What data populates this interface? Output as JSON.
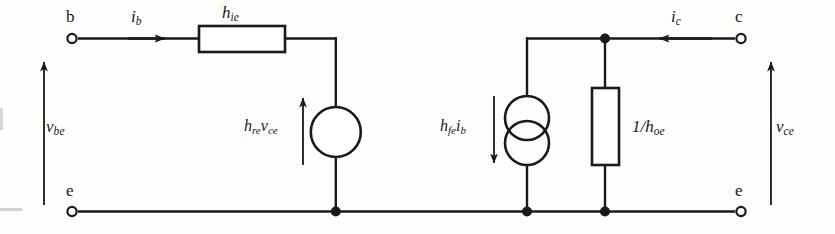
{
  "diagram": {
    "stroke_color": "#1a1a1a",
    "background_color": "#fdfdfc",
    "width": 835,
    "height": 234
  },
  "terminals": [
    {
      "name": "terminal-b",
      "label": "b",
      "x": 72,
      "y": 38,
      "label_x": 66,
      "label_y": 8
    },
    {
      "name": "terminal-c",
      "label": "c",
      "x": 741,
      "y": 38,
      "label_x": 735,
      "label_y": 8
    },
    {
      "name": "terminal-e-left",
      "label": "e",
      "x": 72,
      "y": 211,
      "label_x": 66,
      "label_y": 182
    },
    {
      "name": "terminal-e-right",
      "label": "e",
      "x": 741,
      "y": 211,
      "label_x": 735,
      "label_y": 182
    }
  ],
  "currents": [
    {
      "name": "current-ib",
      "symbol": "i",
      "subscript": "b",
      "direction": "right",
      "label_x": 131,
      "label_y": 8
    },
    {
      "name": "current-ic",
      "symbol": "i",
      "subscript": "c",
      "direction": "left",
      "label_x": 671,
      "label_y": 8
    }
  ],
  "voltages": [
    {
      "name": "voltage-vbe",
      "symbol": "v",
      "subscript": "be",
      "direction": "up",
      "label_x": 46,
      "label_y": 118
    },
    {
      "name": "voltage-vce",
      "symbol": "v",
      "subscript": "ce",
      "direction": "up",
      "label_x": 776,
      "label_y": 118
    }
  ],
  "components": [
    {
      "name": "resistor-hie",
      "type": "resistor-horizontal",
      "symbol": "h",
      "subscript": "ie",
      "label": "h_ie",
      "label_x": 222,
      "label_y": 4
    },
    {
      "name": "voltage-source-hre-vce",
      "type": "voltage-source",
      "label": "h_re v_ce",
      "parts": [
        {
          "symbol": "h",
          "subscript": "re"
        },
        {
          "symbol": "v",
          "subscript": "ce"
        }
      ],
      "arrow_direction": "up",
      "label_x": 244,
      "label_y": 118
    },
    {
      "name": "current-source-hfe-ib",
      "type": "current-source",
      "label": "h_fe i_b",
      "parts": [
        {
          "symbol": "h",
          "subscript": "fe"
        },
        {
          "symbol": "i",
          "subscript": "b"
        }
      ],
      "arrow_direction": "down",
      "label_x": 440,
      "label_y": 118
    },
    {
      "name": "resistor-1-over-hoe",
      "type": "resistor-vertical",
      "prefix": "1/",
      "symbol": "h",
      "subscript": "oe",
      "label": "1/h_oe",
      "label_x": 632,
      "label_y": 118
    }
  ],
  "junctions": [
    {
      "name": "junction-top-right",
      "x": 605,
      "y": 38
    },
    {
      "name": "junction-bottom-mid-left",
      "x": 336,
      "y": 211
    },
    {
      "name": "junction-bottom-current-source",
      "x": 527,
      "y": 211
    },
    {
      "name": "junction-bottom-resistor",
      "x": 605,
      "y": 211
    }
  ]
}
